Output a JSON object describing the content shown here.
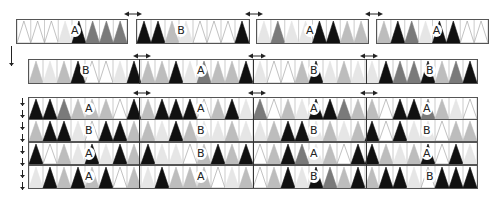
{
  "diagram": {
    "palette": {
      "white": "#ffffff",
      "light": "#e6e6e6",
      "mid": "#bdbdbd",
      "dark": "#7a7a7a",
      "black": "#111111",
      "outline": "#555555"
    },
    "row1": {
      "panels": [
        {
          "x": 16,
          "w": 112,
          "label": "A",
          "label_pos": 0.51,
          "tris": [
            "w",
            "w",
            "w",
            "l",
            "K",
            "d",
            "d",
            "d"
          ]
        },
        {
          "x": 136,
          "w": 114,
          "label": "B",
          "label_pos": 0.38,
          "tris": [
            "K",
            "K",
            "m",
            "l",
            "w",
            "w",
            "w",
            "K"
          ]
        },
        {
          "x": 256,
          "w": 113,
          "label": "A",
          "label_pos": 0.46,
          "tris": [
            "l",
            "d",
            "l",
            "l",
            "K",
            "K",
            "m",
            "m"
          ]
        },
        {
          "x": 376,
          "w": 113,
          "label": "A",
          "label_pos": 0.52,
          "tris": [
            "m",
            "K",
            "d",
            "l",
            "K",
            "K",
            "w",
            "w"
          ]
        }
      ]
    },
    "row2": {
      "x": 28,
      "w": 450,
      "dividers": [
        139,
        253,
        366
      ],
      "labels": [
        {
          "text": "B",
          "x": 80
        },
        {
          "text": "A",
          "x": 195
        },
        {
          "text": "B",
          "x": 308
        },
        {
          "text": "B",
          "x": 424
        }
      ],
      "tris": [
        "m",
        "l",
        "m",
        "K",
        "w",
        "w",
        "l",
        "K",
        "m",
        "m",
        "K",
        "l",
        "d",
        "m",
        "m",
        "K",
        "l",
        "w",
        "w",
        "m",
        "K",
        "l",
        "m",
        "l",
        "l",
        "K",
        "d",
        "d",
        "K",
        "m",
        "d",
        "K"
      ]
    },
    "stack": {
      "x": 28,
      "w": 450,
      "dividers": [
        139,
        253,
        366
      ],
      "rows": [
        {
          "y": 97,
          "labels": [
            {
              "text": "A",
              "x": 83
            },
            {
              "text": "A",
              "x": 195
            },
            {
              "text": "A",
              "x": 308
            },
            {
              "text": "A",
              "x": 421
            }
          ],
          "tris": [
            "K",
            "K",
            "d",
            "m",
            "m",
            "m",
            "w",
            "K",
            "m",
            "K",
            "K",
            "K",
            "w",
            "m",
            "K",
            "l",
            "d",
            "w",
            "m",
            "l",
            "K",
            "K",
            "d",
            "m",
            "m",
            "w",
            "K",
            "K",
            "d",
            "m",
            "l",
            "w"
          ]
        },
        {
          "y": 119,
          "labels": [
            {
              "text": "B",
              "x": 83
            },
            {
              "text": "B",
              "x": 195
            },
            {
              "text": "B",
              "x": 308
            },
            {
              "text": "B",
              "x": 421
            }
          ],
          "tris": [
            "m",
            "K",
            "K",
            "l",
            "w",
            "K",
            "K",
            "m",
            "m",
            "l",
            "K",
            "m",
            "l",
            "l",
            "m",
            "l",
            "l",
            "m",
            "K",
            "K",
            "l",
            "m",
            "l",
            "m",
            "K",
            "w",
            "K",
            "l",
            "l",
            "w",
            "m",
            "m"
          ]
        },
        {
          "y": 142,
          "labels": [
            {
              "text": "A",
              "x": 83
            },
            {
              "text": "B",
              "x": 195
            },
            {
              "text": "A",
              "x": 308
            },
            {
              "text": "A",
              "x": 421
            }
          ],
          "tris": [
            "K",
            "w",
            "m",
            "l",
            "K",
            "l",
            "K",
            "m",
            "K",
            "l",
            "l",
            "w",
            "m",
            "K",
            "m",
            "K",
            "w",
            "m",
            "K",
            "d",
            "l",
            "m",
            "w",
            "K",
            "K",
            "m",
            "l",
            "m",
            "K",
            "w",
            "K",
            "l"
          ]
        },
        {
          "y": 165,
          "labels": [
            {
              "text": "A",
              "x": 83
            },
            {
              "text": "A",
              "x": 195
            },
            {
              "text": "B",
              "x": 308
            },
            {
              "text": "B",
              "x": 424
            }
          ],
          "tris": [
            "l",
            "K",
            "m",
            "K",
            "m",
            "K",
            "w",
            "m",
            "l",
            "K",
            "m",
            "m",
            "m",
            "w",
            "l",
            "m",
            "w",
            "m",
            "K",
            "l",
            "K",
            "d",
            "m",
            "K",
            "m",
            "K",
            "K",
            "l",
            "w",
            "K",
            "K",
            "K"
          ]
        }
      ]
    },
    "h_arrows": [
      {
        "x": 124,
        "y": 11
      },
      {
        "x": 245,
        "y": 11
      },
      {
        "x": 365,
        "y": 11
      },
      {
        "x": 133,
        "y": 53
      },
      {
        "x": 248,
        "y": 53
      },
      {
        "x": 360,
        "y": 53
      },
      {
        "x": 133,
        "y": 90
      },
      {
        "x": 248,
        "y": 90
      },
      {
        "x": 360,
        "y": 90
      }
    ],
    "v_arrows": [
      {
        "x": 9,
        "y": 46,
        "h": 20
      },
      {
        "x": 20,
        "y": 98,
        "h": 8
      },
      {
        "x": 20,
        "y": 110,
        "h": 8
      },
      {
        "x": 20,
        "y": 122,
        "h": 8
      },
      {
        "x": 20,
        "y": 134,
        "h": 8
      },
      {
        "x": 20,
        "y": 146,
        "h": 8
      },
      {
        "x": 20,
        "y": 158,
        "h": 8
      },
      {
        "x": 20,
        "y": 170,
        "h": 8
      },
      {
        "x": 20,
        "y": 182,
        "h": 8
      }
    ]
  }
}
